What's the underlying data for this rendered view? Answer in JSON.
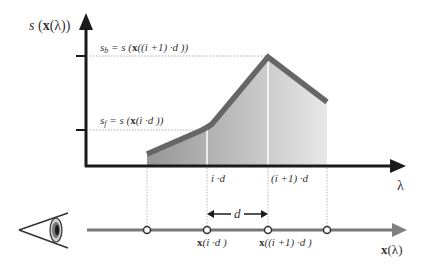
{
  "diagram": {
    "y_axis_label": {
      "s": "s",
      "open": " (",
      "x": "x",
      "lambda_part": "(λ))"
    },
    "x_axis_label": "λ",
    "sb_label": {
      "sym": "s",
      "sub": "b",
      "eq": " = s (",
      "x": "x",
      "rest": "((i +1) ·d ))"
    },
    "sf_label": {
      "sym": "s",
      "sub": "f",
      "eq": " = s (",
      "x": "x",
      "rest": "(i ·d ))"
    },
    "tick_labels": {
      "id": "i ·d",
      "i1d": "(i +1) ·d"
    },
    "ray_labels": {
      "x_id": {
        "x": "x",
        "rest": "(i ·d )"
      },
      "x_i1d": {
        "x": "x",
        "rest": "((i +1) ·d )"
      },
      "d": "d",
      "x_lambda": {
        "x": "x",
        "rest": "(λ)"
      }
    },
    "colors": {
      "axis": "#1a1a1a",
      "curve": "#666666",
      "fill_dark": "#9a9a9a",
      "fill_light": "#e6e6e6",
      "ray": "#777777",
      "guide": "#b0b0b0"
    },
    "curve_points": [
      [
        147,
        154
      ],
      [
        208,
        128
      ],
      [
        268,
        57
      ],
      [
        327,
        102
      ]
    ],
    "sample_points_x": [
      147,
      207,
      268,
      327
    ]
  }
}
